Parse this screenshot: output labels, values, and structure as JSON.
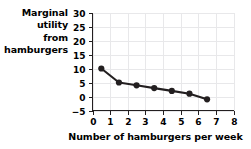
{
  "chart_data": {
    "type": "line",
    "title": "",
    "xlabel": "Number of hamburgers per week",
    "ylabel": "Marginal utility from hamburgers",
    "ylabel_lines": [
      "Marginal",
      "utility",
      "from",
      "hamburgers"
    ],
    "x": [
      0.5,
      1.5,
      2.5,
      3.5,
      4.5,
      5.5,
      6.5
    ],
    "values": [
      10,
      5,
      4,
      3,
      2,
      1,
      -1
    ],
    "series": [
      {
        "name": "Marginal utility from hamburgers",
        "values": [
          10,
          5,
          4,
          3,
          2,
          1,
          -1
        ]
      }
    ],
    "xlim": [
      0,
      8
    ],
    "ylim": [
      -5,
      30
    ],
    "xticks": [
      0,
      1,
      2,
      3,
      4,
      5,
      6,
      7,
      8
    ],
    "xtick_labels": [
      "0",
      "1",
      "2",
      "3",
      "4",
      "5",
      "6",
      "7",
      "8"
    ],
    "yticks": [
      -5,
      0,
      5,
      10,
      15,
      20,
      25,
      30
    ],
    "ytick_labels": [
      "−5",
      "0",
      "5",
      "10",
      "15",
      "20",
      "25",
      "30"
    ],
    "grid": true,
    "legend": false,
    "marker": "circle",
    "line_color": "#231f20",
    "marker_color": "#231f20",
    "grid_color": "#e8e8ea",
    "axis_color": "#231f20",
    "background_color": "#ffffff"
  }
}
